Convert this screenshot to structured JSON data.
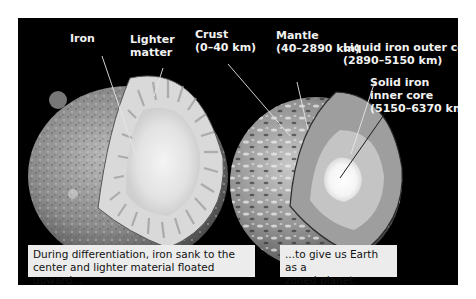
{
  "left_panel": {
    "labels": {
      "iron": "Iron",
      "lighter_matter_line1": "Lighter",
      "lighter_matter_line2": "matter"
    },
    "caption_line1": "During differentiation, iron sank to the",
    "caption_line2": "center and lighter material floated upward..."
  },
  "right_panel": {
    "labels": {
      "crust_name": "Crust",
      "crust_range": "(0–40 km)",
      "mantle_name": "Mantle",
      "mantle_range": "(40–2890 km)",
      "outer_core_name": "Liquid iron outer core",
      "outer_core_range": "(2890–5150 km)",
      "inner_core_line1": "Solid iron",
      "inner_core_line2": "inner core",
      "inner_core_range": "(5150–6370 km)"
    },
    "caption_line1": "...to give us Earth as a",
    "caption_line2": "zoned planet."
  },
  "colors": {
    "background": "#000000",
    "caption_bg": "#ececec",
    "label_text": "#f2f2f2"
  }
}
